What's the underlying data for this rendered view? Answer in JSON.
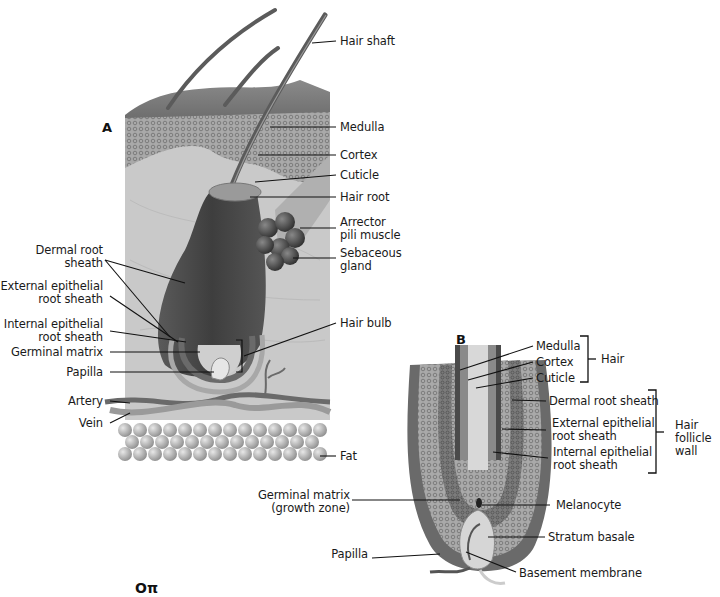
{
  "figure": {
    "panel_a": {
      "letter": "A",
      "labels_right": {
        "hair_shaft": "Hair shaft",
        "medulla": "Medulla",
        "cortex": "Cortex",
        "cuticle": "Cuticle",
        "hair_root": "Hair root",
        "arrector_1": "Arrector",
        "arrector_2": "pili muscle",
        "sebaceous_1": "Sebaceous",
        "sebaceous_2": "gland",
        "hair_bulb": "Hair bulb",
        "fat": "Fat"
      },
      "labels_left": {
        "dermal_1": "Dermal root",
        "dermal_2": "sheath",
        "external_1": "External epithelial",
        "external_2": "root sheath",
        "internal_1": "Internal epithelial",
        "internal_2": "root sheath",
        "germinal": "Germinal matrix",
        "papilla": "Papilla",
        "artery": "Artery",
        "vein": "Vein"
      }
    },
    "panel_b": {
      "letter": "B",
      "labels": {
        "medulla": "Medulla",
        "cortex": "Cortex",
        "cuticle": "Cuticle",
        "hair_group": "Hair",
        "dermal": "Dermal root sheath",
        "external_1": "External epithelial",
        "external_2": "root sheath",
        "internal_1": "Internal epithelial",
        "internal_2": "root sheath",
        "follicle_1": "Hair",
        "follicle_2": "follicle",
        "follicle_3": "wall",
        "germinal_1": "Germinal matrix",
        "germinal_2": "(growth zone)",
        "melanocyte": "Melanocyte",
        "stratum": "Stratum basale",
        "papilla": "Papilla",
        "basement": "Basement membrane"
      }
    },
    "key_icon": "key-icon",
    "key_glyph": "Oπ"
  }
}
